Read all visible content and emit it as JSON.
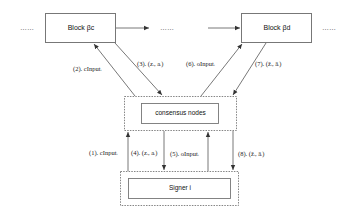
{
  "diagram": {
    "blocks": [
      {
        "id": "block-c",
        "label": "Block βc"
      },
      {
        "id": "block-d",
        "label": "Block βd"
      }
    ],
    "ellipses": [
      "……",
      "……",
      "……"
    ],
    "consensus": {
      "label": "consensus nodes"
    },
    "signer": {
      "label": "Signer i"
    },
    "edges": [
      {
        "step": "(1)",
        "label": "(1). cInputᵢ",
        "from": "signer",
        "to": "consensus"
      },
      {
        "step": "(2)",
        "label": "(2). cInputᵢ",
        "from": "consensus",
        "to": "block-c"
      },
      {
        "step": "(3)",
        "label": "(3). (zᵢ, aᵢ)",
        "from": "block-c",
        "to": "consensus"
      },
      {
        "step": "(4)",
        "label": "(4). (zᵢ, aᵢ)",
        "from": "consensus",
        "to": "signer"
      },
      {
        "step": "(5)",
        "label": "(5). oInputᵢ",
        "from": "signer",
        "to": "consensus"
      },
      {
        "step": "(6)",
        "label": "(6). oInputᵢ",
        "from": "consensus",
        "to": "block-d"
      },
      {
        "step": "(7)",
        "label": "(7). (ẑᵢ, âᵢ)",
        "from": "block-d",
        "to": "consensus"
      },
      {
        "step": "(8)",
        "label": "(8). (ẑᵢ, âᵢ)",
        "from": "consensus",
        "to": "signer"
      }
    ],
    "colors": {
      "stroke": "#555555",
      "text": "#222222",
      "background": "#ffffff"
    }
  }
}
